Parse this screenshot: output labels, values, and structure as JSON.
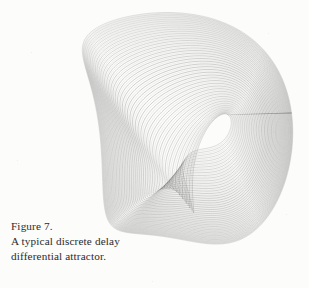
{
  "page": {
    "background_color": "#fcfcfb",
    "width": 309,
    "height": 288
  },
  "caption": {
    "line1": "Figure 7.",
    "line2": "A typical discrete delay",
    "line3": "differential attractor.",
    "text_color": "#2b2b2b"
  },
  "figure": {
    "name": "discrete-delay-differential-attractor",
    "stroke_color": "#3a3a3a",
    "stroke_width": 0.35,
    "stroke_opacity": 0.55
  },
  "chart_data": {
    "type": "line",
    "title": "A typical discrete delay differential attractor",
    "xlabel": "",
    "ylabel": "",
    "grid": false,
    "legend": null,
    "axes_visible": false,
    "xlim": [
      0,
      309
    ],
    "ylim": [
      0,
      288
    ],
    "series_count": 46,
    "series_description": "Nested quasi-parallel trajectory strands of a delay differential equation attractor; each strand follows the same folded closed loop, offset progressively inward.",
    "loop_control_points": [
      {
        "name": "left-beak-tip",
        "x": 62,
        "y": 103
      },
      {
        "name": "upper-left-cusp",
        "x": 120,
        "y": 62
      },
      {
        "name": "top-crest",
        "x": 186,
        "y": 18
      },
      {
        "name": "right-shoulder",
        "x": 243,
        "y": 52
      },
      {
        "name": "right-descent",
        "x": 262,
        "y": 140
      },
      {
        "name": "lower-right-lobe",
        "x": 250,
        "y": 238
      },
      {
        "name": "bottom-turn",
        "x": 205,
        "y": 262
      },
      {
        "name": "inner-return",
        "x": 160,
        "y": 210
      },
      {
        "name": "inner-spiral-eye",
        "x": 206,
        "y": 78
      },
      {
        "name": "left-return",
        "x": 92,
        "y": 128
      }
    ],
    "offsets": [
      0,
      1.1,
      2.2,
      3.4,
      4.6,
      5.9,
      7.2,
      8.6,
      10.0,
      11.5,
      13.0,
      14.6,
      16.2,
      17.9,
      19.6,
      21.4,
      23.2,
      25.1,
      27.0,
      29.0,
      31.0,
      33.1,
      35.2,
      37.4,
      39.6,
      41.9,
      44.2,
      46.6,
      49.0,
      51.5,
      54.0,
      56.6,
      59.2,
      61.9,
      64.6,
      67.4,
      70.2,
      73.1,
      76.0,
      79.0,
      82.0,
      85.1,
      88.2,
      91.4,
      94.6,
      97.9
    ]
  }
}
